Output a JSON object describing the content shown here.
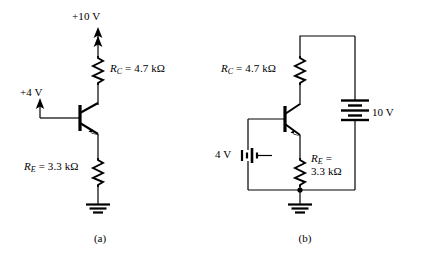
{
  "figure": {
    "type": "circuit-schematic",
    "width": 423,
    "height": 259,
    "line_color": "#000000",
    "background": "#ffffff"
  },
  "circuit_a": {
    "caption": "(a)",
    "supply_label": "+10 V",
    "base_supply_label": "+4 V",
    "collector_resistor": {
      "symbol": "R",
      "subscript": "C",
      "equals": " = ",
      "value": "4.7 kΩ"
    },
    "emitter_resistor": {
      "symbol": "R",
      "subscript": "E",
      "equals": " = ",
      "value": "3.3 kΩ"
    },
    "device": "npn-bjt",
    "ground": "earth-ground"
  },
  "circuit_b": {
    "caption": "(b)",
    "supply_label": "10 V",
    "base_supply_label": "4 V",
    "collector_resistor": {
      "symbol": "R",
      "subscript": "C",
      "equals": " = ",
      "value": "4.7 kΩ"
    },
    "emitter_resistor": {
      "symbol": "R",
      "subscript": "E",
      "equals": " =",
      "value": "3.3 kΩ"
    },
    "device": "npn-bjt",
    "ground": "earth-ground"
  }
}
